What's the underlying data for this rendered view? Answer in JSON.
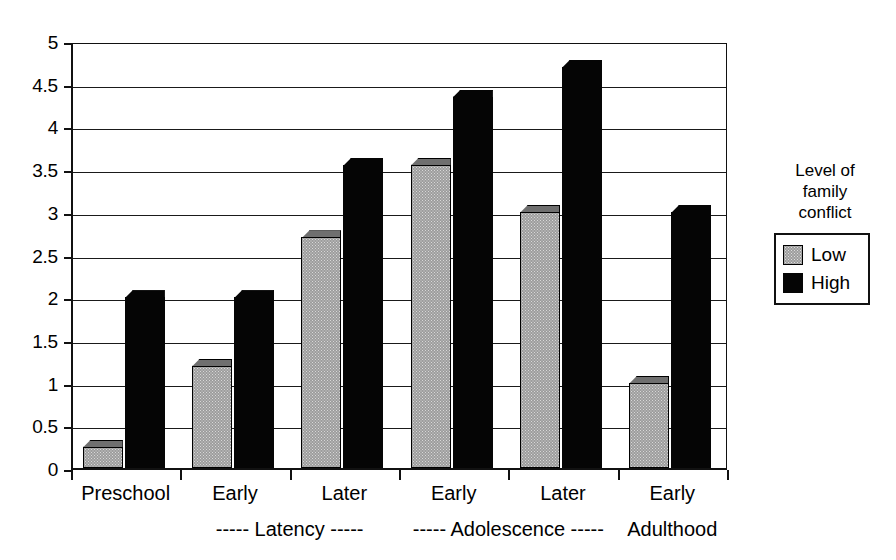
{
  "chart_data": {
    "type": "bar",
    "title": "",
    "xlabel": "",
    "ylabel": "",
    "ylim": [
      0,
      5
    ],
    "ytick_step": 0.5,
    "ytick_labels": [
      "5",
      "4.5",
      "4",
      "3.5",
      "3",
      "2.5",
      "2",
      "1.5",
      "1",
      "0.5",
      "0"
    ],
    "ytick_values": [
      5,
      4.5,
      4,
      3.5,
      3,
      2.5,
      2,
      1.5,
      1,
      0.5,
      0
    ],
    "grid": true,
    "grid_axis": "y",
    "legend_position": "right",
    "categories": [
      "Preschool",
      "Early",
      "Later",
      "Early",
      "Later",
      "Early"
    ],
    "group_labels": [
      "----- Latency -----",
      "----- Adolescence -----",
      "Adulthood"
    ],
    "series": [
      {
        "name": "Low",
        "color": "#9d9d9d",
        "values": [
          0.25,
          1.2,
          2.7,
          3.55,
          3.0,
          1.0
        ]
      },
      {
        "name": "High",
        "color": "#050505",
        "values": [
          2.0,
          2.0,
          3.55,
          4.35,
          4.7,
          3.0
        ]
      }
    ],
    "legend": {
      "title": "Level of family conflict",
      "title_lines": [
        "Level of",
        "family",
        "conflict"
      ],
      "entries": [
        {
          "label": "Low",
          "swatch": "low"
        },
        {
          "label": "High",
          "swatch": "high"
        }
      ]
    }
  },
  "axis": {
    "y_labels": [
      "5",
      "4.5",
      "4",
      "3.5",
      "3",
      "2.5",
      "2",
      "1.5",
      "1",
      "0.5",
      "0"
    ]
  },
  "category_labels": [
    "Preschool",
    "Early",
    "Later",
    "Early",
    "Later",
    "Early"
  ],
  "group_labels": [
    "----- Latency -----",
    "----- Adolescence -----",
    "Adulthood"
  ],
  "legend": {
    "line1": "Level of",
    "line2": "family",
    "line3": "conflict",
    "low": "Low",
    "high": "High"
  }
}
